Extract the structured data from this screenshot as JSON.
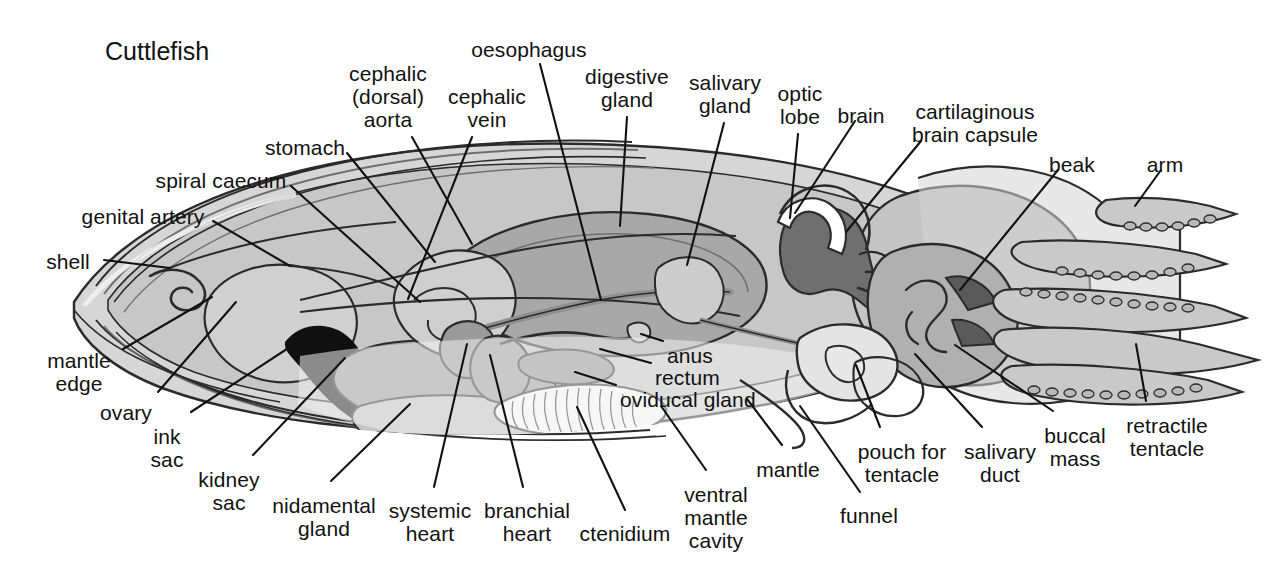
{
  "figure": {
    "title": "Cuttlefish",
    "width": 1276,
    "height": 572,
    "background": "#ffffff",
    "ink": "#111111",
    "palette": {
      "outline": "#2b2b2b",
      "mantle_outer": "#d6d6d6",
      "mantle_inner": "#c4c4c4",
      "mantle_cavity": "#ededed",
      "organ_mid": "#b0b0b0",
      "organ_dark": "#8f8f8f",
      "organ_darker": "#6f6f6f",
      "ink_sac": "#101010",
      "highlight": "#f2f2f2",
      "white": "#ffffff"
    }
  },
  "labels": [
    {
      "id": "cuttlefish",
      "text": "Cuttlefish",
      "x": 105,
      "y": 38,
      "align": "l",
      "lines": 1
    },
    {
      "id": "oesophagus",
      "text": "oesophagus",
      "x": 529,
      "y": 38,
      "align": "c",
      "lines": 1
    },
    {
      "id": "cephalic-dorsal-aorta",
      "text": "cephalic\n(dorsal)\naorta",
      "x": 388,
      "y": 62,
      "align": "c",
      "lines": 3
    },
    {
      "id": "cephalic-vein",
      "text": "cephalic\nvein",
      "x": 487,
      "y": 85,
      "align": "c",
      "lines": 2
    },
    {
      "id": "digestive-gland",
      "text": "digestive\ngland",
      "x": 627,
      "y": 65,
      "align": "c",
      "lines": 2
    },
    {
      "id": "salivary-gland",
      "text": "salivary\ngland",
      "x": 725,
      "y": 71,
      "align": "c",
      "lines": 2
    },
    {
      "id": "optic-lobe",
      "text": "optic\nlobe",
      "x": 800,
      "y": 82,
      "align": "c",
      "lines": 2
    },
    {
      "id": "brain",
      "text": "brain",
      "x": 861,
      "y": 104,
      "align": "c",
      "lines": 1
    },
    {
      "id": "cartilaginous-brain-capsule",
      "text": "cartilaginous\nbrain capsule",
      "x": 975,
      "y": 100,
      "align": "c",
      "lines": 2
    },
    {
      "id": "beak",
      "text": "beak",
      "x": 1072,
      "y": 153,
      "align": "c",
      "lines": 1
    },
    {
      "id": "arm",
      "text": "arm",
      "x": 1165,
      "y": 153,
      "align": "c",
      "lines": 1
    },
    {
      "id": "stomach",
      "text": "stomach",
      "x": 305,
      "y": 136,
      "align": "c",
      "lines": 1
    },
    {
      "id": "spiral-caecum",
      "text": "spiral caecum",
      "x": 221,
      "y": 169,
      "align": "c",
      "lines": 1
    },
    {
      "id": "genital-artery",
      "text": "genital artery",
      "x": 143,
      "y": 205,
      "align": "c",
      "lines": 1
    },
    {
      "id": "shell",
      "text": "shell",
      "x": 68,
      "y": 250,
      "align": "c",
      "lines": 1
    },
    {
      "id": "mantle-edge",
      "text": "mantle\nedge",
      "x": 79,
      "y": 349,
      "align": "c",
      "lines": 2
    },
    {
      "id": "ovary",
      "text": "ovary",
      "x": 126,
      "y": 401,
      "align": "c",
      "lines": 1
    },
    {
      "id": "ink-sac",
      "text": "ink\nsac",
      "x": 167,
      "y": 425,
      "align": "c",
      "lines": 2
    },
    {
      "id": "kidney-sac",
      "text": "kidney\nsac",
      "x": 229,
      "y": 468,
      "align": "c",
      "lines": 2
    },
    {
      "id": "nidamental-gland",
      "text": "nidamental\ngland",
      "x": 324,
      "y": 494,
      "align": "c",
      "lines": 2
    },
    {
      "id": "systemic-heart",
      "text": "systemic\nheart",
      "x": 430,
      "y": 499,
      "align": "c",
      "lines": 2
    },
    {
      "id": "branchial-heart",
      "text": "branchial\nheart",
      "x": 527,
      "y": 499,
      "align": "c",
      "lines": 2
    },
    {
      "id": "ctenidium",
      "text": "ctenidium",
      "x": 625,
      "y": 522,
      "align": "c",
      "lines": 1
    },
    {
      "id": "ventral-mantle-cavity",
      "text": "ventral\nmantle\ncavity",
      "x": 716,
      "y": 483,
      "align": "c",
      "lines": 3
    },
    {
      "id": "mantle",
      "text": "mantle",
      "x": 788,
      "y": 458,
      "align": "c",
      "lines": 1
    },
    {
      "id": "funnel",
      "text": "funnel",
      "x": 869,
      "y": 504,
      "align": "c",
      "lines": 1
    },
    {
      "id": "pouch-for-tentacle",
      "text": "pouch for\ntentacle",
      "x": 902,
      "y": 440,
      "align": "c",
      "lines": 2
    },
    {
      "id": "salivary-duct",
      "text": "salivary\nduct",
      "x": 1000,
      "y": 440,
      "align": "c",
      "lines": 2
    },
    {
      "id": "buccal-mass",
      "text": "buccal\nmass",
      "x": 1075,
      "y": 424,
      "align": "c",
      "lines": 2
    },
    {
      "id": "retractile-tentacle",
      "text": "retractile\ntentacle",
      "x": 1167,
      "y": 414,
      "align": "c",
      "lines": 2
    },
    {
      "id": "anus",
      "text": "anus",
      "x": 667,
      "y": 344,
      "align": "l",
      "lines": 1
    },
    {
      "id": "rectum",
      "text": "rectum",
      "x": 655,
      "y": 366,
      "align": "l",
      "lines": 1
    },
    {
      "id": "oviducal-gland",
      "text": "oviducal gland",
      "x": 620,
      "y": 388,
      "align": "l",
      "lines": 1
    }
  ],
  "leaders": [
    {
      "id": "oesophagus-leader",
      "from": [
        540,
        64
      ],
      "to": [
        601,
        300
      ]
    },
    {
      "id": "cephalic-dorsal-aorta-leader",
      "from": [
        412,
        137
      ],
      "to": [
        472,
        244
      ]
    },
    {
      "id": "cephalic-vein-leader",
      "from": [
        472,
        137
      ],
      "to": [
        408,
        299
      ]
    },
    {
      "id": "digestive-gland-leader",
      "from": [
        627,
        117
      ],
      "to": [
        620,
        226
      ]
    },
    {
      "id": "salivary-gland-leader",
      "from": [
        724,
        123
      ],
      "to": [
        687,
        265
      ]
    },
    {
      "id": "optic-lobe-leader",
      "from": [
        798,
        134
      ],
      "to": [
        790,
        218
      ]
    },
    {
      "id": "brain-leader",
      "from": [
        855,
        121
      ],
      "to": [
        795,
        213
      ]
    },
    {
      "id": "cartilaginous-capsule-leader",
      "from": [
        921,
        141
      ],
      "to": [
        846,
        232
      ]
    },
    {
      "id": "beak-leader",
      "from": [
        1058,
        170
      ],
      "to": [
        960,
        290
      ]
    },
    {
      "id": "arm-leader",
      "from": [
        1161,
        170
      ],
      "to": [
        1135,
        206
      ]
    },
    {
      "id": "stomach-leader",
      "from": [
        347,
        153
      ],
      "to": [
        435,
        262
      ]
    },
    {
      "id": "spiral-caecum-leader",
      "from": [
        291,
        186
      ],
      "to": [
        420,
        302
      ]
    },
    {
      "id": "genital-artery-leader",
      "from": [
        213,
        221
      ],
      "to": [
        290,
        266
      ]
    },
    {
      "id": "shell-leader",
      "from": [
        104,
        260
      ],
      "to": [
        170,
        268
      ]
    },
    {
      "id": "mantle-edge-leader",
      "from": [
        123,
        349
      ],
      "to": [
        212,
        297
      ]
    },
    {
      "id": "ovary-leader",
      "from": [
        158,
        392
      ],
      "to": [
        236,
        302
      ]
    },
    {
      "id": "ink-sac-leader",
      "from": [
        191,
        412
      ],
      "to": [
        293,
        345
      ]
    },
    {
      "id": "kidney-sac-leader",
      "from": [
        253,
        455
      ],
      "to": [
        345,
        358
      ]
    },
    {
      "id": "nidamental-gland-leader",
      "from": [
        331,
        481
      ],
      "to": [
        410,
        404
      ]
    },
    {
      "id": "systemic-heart-leader",
      "from": [
        434,
        487
      ],
      "to": [
        467,
        344
      ]
    },
    {
      "id": "branchial-heart-leader",
      "from": [
        523,
        487
      ],
      "to": [
        490,
        355
      ]
    },
    {
      "id": "ctenidium-leader",
      "from": [
        625,
        510
      ],
      "to": [
        577,
        407
      ]
    },
    {
      "id": "ventral-mantle-cavity-leader",
      "from": [
        706,
        470
      ],
      "to": [
        661,
        406
      ]
    },
    {
      "id": "mantle-leader",
      "from": [
        782,
        445
      ],
      "to": [
        747,
        399
      ]
    },
    {
      "id": "funnel-leader",
      "from": [
        860,
        492
      ],
      "to": [
        800,
        406
      ]
    },
    {
      "id": "pouch-for-tentacle-leader",
      "from": [
        880,
        427
      ],
      "to": [
        856,
        365
      ]
    },
    {
      "id": "salivary-duct-leader",
      "from": [
        982,
        427
      ],
      "to": [
        915,
        354
      ]
    },
    {
      "id": "buccal-mass-leader",
      "from": [
        1053,
        411
      ],
      "to": [
        955,
        345
      ]
    },
    {
      "id": "retractile-tentacle-leader",
      "from": [
        1146,
        401
      ],
      "to": [
        1136,
        344
      ]
    },
    {
      "id": "anus-leader",
      "from": [
        663,
        341
      ],
      "to": [
        641,
        334
      ]
    },
    {
      "id": "rectum-leader",
      "from": [
        651,
        363
      ],
      "to": [
        600,
        349
      ]
    },
    {
      "id": "oviducal-gland-leader",
      "from": [
        616,
        385
      ],
      "to": [
        575,
        372
      ]
    }
  ],
  "structures": [
    {
      "id": "mantle-body",
      "name": "mantle-body"
    },
    {
      "id": "shell-plate",
      "name": "shell-plate"
    },
    {
      "id": "mantle-cavity",
      "name": "ventral-mantle-cavity"
    },
    {
      "id": "ink-sac",
      "name": "ink-sac"
    },
    {
      "id": "ovary",
      "name": "ovary"
    },
    {
      "id": "kidney-sac",
      "name": "kidney-sac"
    },
    {
      "id": "nidamental-gland",
      "name": "nidamental-gland"
    },
    {
      "id": "digestive-gland",
      "name": "digestive-gland"
    },
    {
      "id": "stomach",
      "name": "stomach"
    },
    {
      "id": "spiral-caecum",
      "name": "spiral-caecum"
    },
    {
      "id": "ctenidium",
      "name": "ctenidium-gill"
    },
    {
      "id": "systemic-heart",
      "name": "systemic-heart"
    },
    {
      "id": "branchial-heart",
      "name": "branchial-heart"
    },
    {
      "id": "brain-mass",
      "name": "brain"
    },
    {
      "id": "optic-lobe",
      "name": "optic-lobe"
    },
    {
      "id": "buccal-mass",
      "name": "buccal-mass"
    },
    {
      "id": "beak",
      "name": "beak"
    },
    {
      "id": "funnel",
      "name": "funnel"
    },
    {
      "id": "arms",
      "name": "arms"
    },
    {
      "id": "retractile-tentacle",
      "name": "retractile-tentacle"
    }
  ]
}
